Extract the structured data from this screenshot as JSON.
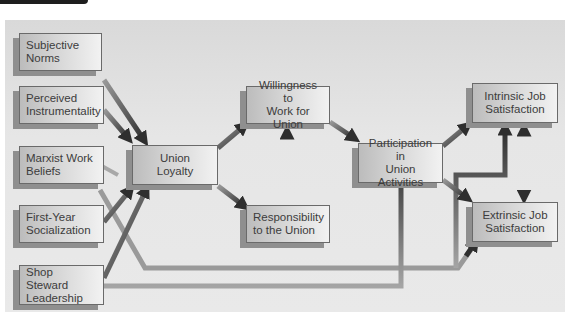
{
  "figure": {
    "type": "path-diagram",
    "colors": {
      "panel_background": "#e4e4e4",
      "node_fill_dark": "#bcbcbc",
      "node_fill_light": "#f2f2f2",
      "node_shadow": "#8f8f8f",
      "arrow_dark": "#3a3a3a",
      "arrow_light": "#9a9a9a",
      "text": "#3c3c3c"
    }
  },
  "nodes": {
    "subjective_norms": {
      "line1": "Subjective",
      "line2": "Norms"
    },
    "perceived_instrumentality": {
      "line1": "Perceived",
      "line2": "Instrumentality"
    },
    "marxist_work_beliefs": {
      "line1": "Marxist Work",
      "line2": "Beliefs"
    },
    "first_year_socialization": {
      "line1": "First-Year",
      "line2": "Socialization"
    },
    "shop_steward_leadership": {
      "line1": "Shop Steward",
      "line2": "Leadership"
    },
    "union_loyalty": {
      "line1": "Union",
      "line2": "Loyalty"
    },
    "willingness_to_work": {
      "line1": "Willingness to",
      "line2": "Work for Union"
    },
    "responsibility_to_union": {
      "line1": "Responsibility",
      "line2": "to the Union"
    },
    "participation": {
      "line1": "Participation in",
      "line2": "Union Activities"
    },
    "intrinsic_job_satisfaction": {
      "line1": "Intrinsic Job",
      "line2": "Satisfaction"
    },
    "extrinsic_job_satisfaction": {
      "line1": "Extrinsic Job",
      "line2": "Satisfaction"
    }
  },
  "edges": [
    {
      "from": "Subjective Norms",
      "to": "Union Loyalty"
    },
    {
      "from": "Perceived Instrumentality",
      "to": "Union Loyalty"
    },
    {
      "from": "First-Year Socialization",
      "to": "Union Loyalty"
    },
    {
      "from": "Shop Steward Leadership",
      "to": "Union Loyalty"
    },
    {
      "from": "Union Loyalty",
      "to": "Willingness to Work for Union"
    },
    {
      "from": "Union Loyalty",
      "to": "Responsibility to the Union"
    },
    {
      "from": "Responsibility to the Union",
      "to": "Willingness to Work for Union"
    },
    {
      "from": "Willingness to Work for Union",
      "to": "Participation in Union Activities"
    },
    {
      "from": "Participation in Union Activities",
      "to": "Intrinsic Job Satisfaction"
    },
    {
      "from": "Participation in Union Activities",
      "to": "Extrinsic Job Satisfaction"
    },
    {
      "from": "Shop Steward Leadership",
      "to": "Participation in Union Activities"
    },
    {
      "from": "Marxist Work Beliefs",
      "to": "Extrinsic Job Satisfaction"
    },
    {
      "from": "Marxist Work Beliefs",
      "to": "Intrinsic Job Satisfaction"
    },
    {
      "from": "Intrinsic Job Satisfaction",
      "to": "Extrinsic Job Satisfaction",
      "bidirectional": true
    }
  ]
}
